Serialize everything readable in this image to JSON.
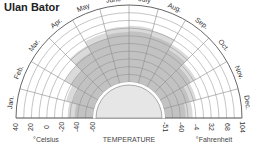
{
  "title": "Ulan Bator",
  "chart_data": {
    "type": "radial-area",
    "title": "Ulan Bator",
    "xlabel": "TEMPERATURE",
    "categories": [
      "Jan.",
      "Feb.",
      "Mar.",
      "Apr.",
      "May",
      "June",
      "July",
      "Aug.",
      "Sep.",
      "Oct.",
      "Nov.",
      "Dec."
    ],
    "radial_axis": {
      "celsius_label": "°Celsius",
      "fahrenheit_label": "°Fahrenheit",
      "celsius_ticks": [
        "40",
        "20",
        "0",
        "-20",
        "-40",
        "-60"
      ],
      "fahrenheit_ticks": [
        "-51",
        "-40",
        "-4",
        "32",
        "68",
        "104"
      ],
      "range_celsius": [
        -60,
        40
      ]
    },
    "series": [
      {
        "name": "extreme range (light gray)",
        "color": "#dadada",
        "min": [
          -60,
          -60,
          -60,
          -60,
          -60,
          -60,
          -60,
          -60,
          -60,
          -60,
          -60,
          -60
        ],
        "max": [
          -27,
          -22,
          -10,
          2,
          8,
          12,
          13,
          11,
          4,
          -6,
          -16,
          -24
        ]
      },
      {
        "name": "average range (dark gray)",
        "color": "#c2c2c2",
        "min": [
          -60,
          -60,
          -60,
          -60,
          -60,
          -60,
          -60,
          -60,
          -60,
          -60,
          -60,
          -60
        ],
        "max": [
          -36,
          -31,
          -20,
          -8,
          0,
          5,
          6,
          4,
          -4,
          -14,
          -25,
          -33
        ]
      }
    ],
    "grid": true
  }
}
